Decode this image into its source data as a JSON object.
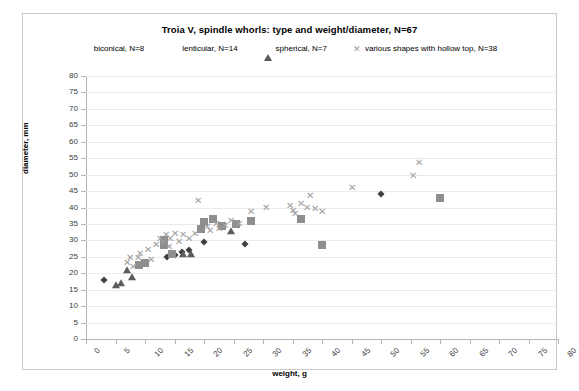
{
  "chart_data": {
    "type": "scatter",
    "title": "Troia V, spindle whorls: type and weight/diameter, N=67",
    "xlabel": "weight, g",
    "ylabel": "diameter, mm",
    "xlim": [
      0,
      80
    ],
    "ylim": [
      0,
      80
    ],
    "xticks": [
      0,
      5,
      10,
      15,
      20,
      25,
      30,
      35,
      40,
      45,
      50,
      55,
      60,
      65,
      70,
      75,
      80
    ],
    "yticks": [
      0,
      5,
      10,
      15,
      20,
      25,
      30,
      35,
      40,
      45,
      50,
      55,
      60,
      65,
      70,
      75,
      80
    ],
    "grid": "horizontal",
    "legend_position": "top",
    "series": [
      {
        "name": "biconical, N=8",
        "marker": "diamond",
        "color": "#3f3f3f",
        "points": [
          [
            3.0,
            18.0
          ],
          [
            13.8,
            25.0
          ],
          [
            15.0,
            25.5
          ],
          [
            16.2,
            26.5
          ],
          [
            17.5,
            27.0
          ],
          [
            20.0,
            29.5
          ],
          [
            27.0,
            29.0
          ],
          [
            50.0,
            44.0
          ]
        ]
      },
      {
        "name": "lenticular, N=14",
        "marker": "square",
        "color": "#8e8e8e",
        "points": [
          [
            9.0,
            22.5
          ],
          [
            10.0,
            23.0
          ],
          [
            13.2,
            28.5
          ],
          [
            13.2,
            30.0
          ],
          [
            14.5,
            26.0
          ],
          [
            19.5,
            33.5
          ],
          [
            20.0,
            35.5
          ],
          [
            21.5,
            36.5
          ],
          [
            23.0,
            34.5
          ],
          [
            25.5,
            35.0
          ],
          [
            28.0,
            36.0
          ],
          [
            36.5,
            36.5
          ],
          [
            40.0,
            28.5
          ],
          [
            60.0,
            43.0
          ]
        ]
      },
      {
        "name": "spherical, N=7",
        "marker": "triangle",
        "color": "#5c5c5c",
        "points": [
          [
            5.0,
            16.5
          ],
          [
            6.0,
            17.0
          ],
          [
            7.0,
            21.0
          ],
          [
            7.8,
            19.0
          ],
          [
            16.5,
            26.0
          ],
          [
            17.8,
            26.0
          ],
          [
            24.5,
            33.0
          ]
        ]
      },
      {
        "name": "various shapes with hollow top, N=38",
        "marker": "cross",
        "color": "#a0a0a0",
        "points": [
          [
            7.0,
            23.0
          ],
          [
            7.5,
            24.5
          ],
          [
            8.0,
            22.0
          ],
          [
            8.8,
            24.5
          ],
          [
            9.2,
            26.0
          ],
          [
            10.5,
            27.0
          ],
          [
            11.0,
            24.0
          ],
          [
            11.8,
            28.5
          ],
          [
            12.5,
            30.5
          ],
          [
            13.0,
            29.5
          ],
          [
            13.5,
            31.5
          ],
          [
            14.0,
            28.0
          ],
          [
            14.2,
            30.5
          ],
          [
            15.0,
            32.0
          ],
          [
            15.8,
            29.5
          ],
          [
            16.5,
            31.5
          ],
          [
            17.5,
            30.5
          ],
          [
            18.5,
            32.0
          ],
          [
            19.0,
            42.0
          ],
          [
            20.5,
            34.0
          ],
          [
            21.0,
            33.0
          ],
          [
            22.0,
            35.0
          ],
          [
            22.5,
            33.5
          ],
          [
            23.5,
            34.5
          ],
          [
            24.5,
            36.0
          ],
          [
            26.0,
            35.0
          ],
          [
            28.0,
            38.5
          ],
          [
            30.5,
            40.0
          ],
          [
            34.5,
            40.5
          ],
          [
            35.0,
            39.0
          ],
          [
            35.5,
            38.0
          ],
          [
            36.5,
            41.0
          ],
          [
            37.5,
            40.0
          ],
          [
            38.0,
            43.5
          ],
          [
            38.8,
            39.5
          ],
          [
            40.0,
            38.5
          ],
          [
            45.0,
            46.0
          ],
          [
            55.5,
            49.5
          ],
          [
            56.5,
            53.5
          ]
        ]
      }
    ]
  }
}
